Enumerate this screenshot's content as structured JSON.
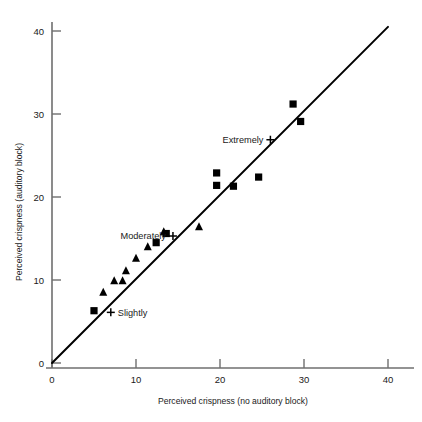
{
  "chart_data": {
    "type": "scatter",
    "title": "",
    "xlabel": "Perceived crispness (no auditory block)",
    "ylabel": "Perceived crispness (auditory block)",
    "xlim": [
      0,
      42
    ],
    "ylim": [
      0,
      42
    ],
    "xticks": [
      0,
      10,
      20,
      30,
      40
    ],
    "yticks": [
      0,
      10,
      20,
      30,
      40
    ],
    "xtick_labels": [
      "0",
      "10",
      "20",
      "30",
      "40"
    ],
    "ytick_labels": [
      "0",
      "10",
      "20",
      "30",
      "40"
    ],
    "grid": false,
    "legend": "none",
    "series": [
      {
        "name": "squares",
        "marker": "square",
        "color": "#000000",
        "points": [
          {
            "x": 5.0,
            "y": 6.3
          },
          {
            "x": 12.4,
            "y": 14.5
          },
          {
            "x": 13.6,
            "y": 15.6
          },
          {
            "x": 19.6,
            "y": 22.9
          },
          {
            "x": 19.6,
            "y": 21.4
          },
          {
            "x": 21.6,
            "y": 21.3
          },
          {
            "x": 24.6,
            "y": 22.4
          },
          {
            "x": 28.7,
            "y": 31.2
          },
          {
            "x": 29.6,
            "y": 29.1
          }
        ]
      },
      {
        "name": "triangles",
        "marker": "triangle",
        "color": "#000000",
        "points": [
          {
            "x": 6.1,
            "y": 8.5
          },
          {
            "x": 7.4,
            "y": 9.9
          },
          {
            "x": 8.4,
            "y": 9.9
          },
          {
            "x": 8.8,
            "y": 11.1
          },
          {
            "x": 10.0,
            "y": 12.6
          },
          {
            "x": 11.4,
            "y": 14.0
          },
          {
            "x": 13.3,
            "y": 15.8
          },
          {
            "x": 17.5,
            "y": 16.4
          }
        ]
      },
      {
        "name": "plus-anchors",
        "marker": "plus",
        "color": "#000000",
        "points": [
          {
            "x": 7.0,
            "y": 6.1,
            "label": "Slightly"
          },
          {
            "x": 14.4,
            "y": 15.3,
            "label": "Moderately"
          },
          {
            "x": 26.0,
            "y": 26.9,
            "label": "Extremely"
          }
        ]
      }
    ],
    "reference_line": {
      "from": {
        "x": 0,
        "y": 0
      },
      "to": {
        "x": 40,
        "y": 40.5
      },
      "style": "solid",
      "color": "#000000"
    },
    "annotations": [
      {
        "text": "Slightly",
        "x": 7.0,
        "y": 6.1,
        "anchor": "left"
      },
      {
        "text": "Moderately",
        "x": 14.4,
        "y": 15.3,
        "anchor": "right"
      },
      {
        "text": "Extremely",
        "x": 26.0,
        "y": 26.9,
        "anchor": "right"
      }
    ]
  },
  "axes": {
    "x_title": "Perceived crispness (no auditory block)",
    "y_title": "Perceived crispness (auditory block)",
    "x_ticks": [
      "0",
      "10",
      "20",
      "30",
      "40"
    ],
    "y_ticks": [
      "0",
      "10",
      "20",
      "30",
      "40"
    ]
  },
  "labels": {
    "slightly": "Slightly",
    "moderately": "Moderately",
    "extremely": "Extremely"
  }
}
